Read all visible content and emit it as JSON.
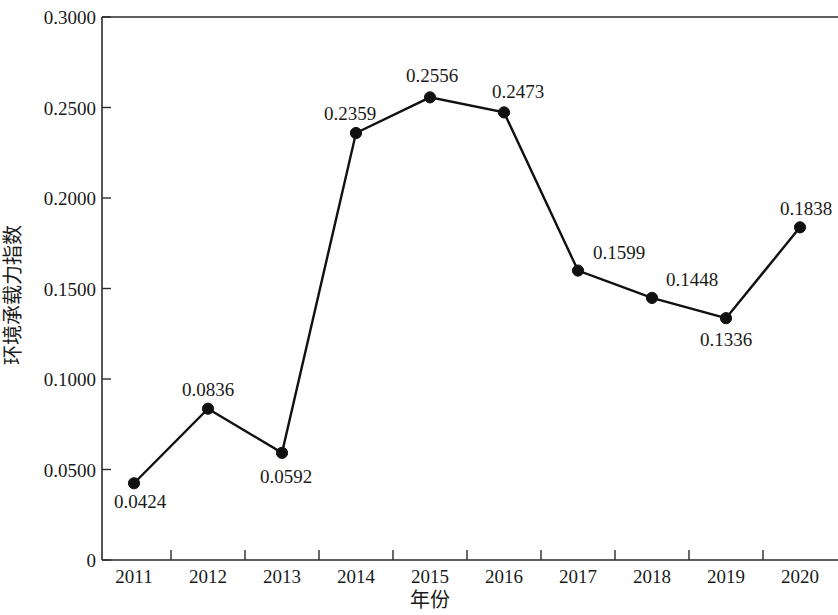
{
  "chart_data": {
    "type": "line",
    "title": "",
    "xlabel": "年份",
    "ylabel": "环境承载力指数",
    "categories": [
      "2011",
      "2012",
      "2013",
      "2014",
      "2015",
      "2016",
      "2017",
      "2018",
      "2019",
      "2020"
    ],
    "values": [
      0.0424,
      0.0836,
      0.0592,
      0.2359,
      0.2556,
      0.2473,
      0.1599,
      0.1448,
      0.1336,
      0.1838
    ],
    "point_labels": [
      "0.0424",
      "0.0836",
      "0.0592",
      "0.2359",
      "0.2556",
      "0.2473",
      "0.1599",
      "0.1448",
      "0.1336",
      "0.1838"
    ],
    "label_positions": [
      "below-right",
      "above",
      "below-right",
      "above-left",
      "above",
      "above-right",
      "above-right",
      "above",
      "below",
      "above"
    ],
    "ylim": [
      0,
      0.3
    ],
    "yticks": [
      0,
      0.05,
      0.1,
      0.15,
      0.2,
      0.25,
      0.3
    ],
    "ytick_labels": [
      "0",
      "0.0500",
      "0.1000",
      "0.1500",
      "0.2000",
      "0.2500",
      "0.3000"
    ],
    "grid": false,
    "legend": null,
    "marker": "filled-circle",
    "series_color": "#111111",
    "axis_color": "#2b2b2b"
  },
  "axes": {
    "y_title": "环境承载力指数",
    "x_title": "年份"
  }
}
